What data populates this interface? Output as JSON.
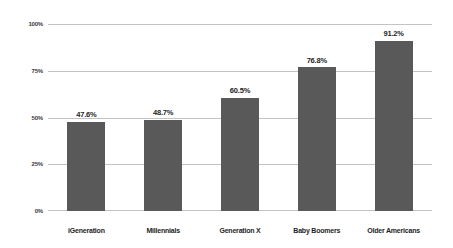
{
  "chart_data": {
    "type": "bar",
    "title": "",
    "subtitle": "",
    "xlabel": "",
    "ylabel": "",
    "categories": [
      "iGeneration",
      "Millennials",
      "Generation X",
      "Baby Boomers",
      "Older Americans"
    ],
    "values": [
      47.6,
      48.7,
      60.5,
      76.8,
      91.2
    ],
    "value_labels": [
      "47.6%",
      "48.7%",
      "60.5%",
      "76.8%",
      "91.2%"
    ],
    "ylim": [
      0,
      100
    ],
    "yticks": [
      0,
      25,
      50,
      75,
      100
    ],
    "ytick_labels": [
      "0%",
      "25%",
      "50%",
      "75%",
      "100%"
    ],
    "grid": true,
    "legend": "none",
    "colors": {
      "bar": "#595959",
      "gridline": "#c3c3c3",
      "text": "#1e1e1e",
      "tick_text": "#3a3a3a",
      "background": "#ffffff"
    }
  }
}
